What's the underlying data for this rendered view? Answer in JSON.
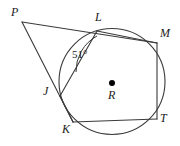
{
  "figure": {
    "type": "circle-geometry-diagram",
    "stroke_color": "#3a3a3a",
    "label_color": "#1a1a1a",
    "background_color": "#ffffff",
    "center_label": "R",
    "center_dot": {
      "x": 112,
      "y": 83,
      "r": 3
    },
    "circle": {
      "cx": 112,
      "cy": 81.5,
      "r": 53
    },
    "angle_marks": [
      {
        "name": "angle-at-L",
        "text": "51°",
        "label_x": 72,
        "label_y": 49,
        "arc_path": "M 76 72 A 40 40 0 0 1 97 36"
      }
    ],
    "points": [
      {
        "name": "P",
        "label": "P",
        "x": 22,
        "y": 22,
        "label_x": 11,
        "label_y": 6,
        "on_circle": false
      },
      {
        "name": "L",
        "label": "L",
        "x": 97,
        "y": 31,
        "label_x": 95,
        "label_y": 11,
        "on_circle": true
      },
      {
        "name": "M",
        "label": "M",
        "x": 157,
        "y": 43,
        "label_x": 160,
        "label_y": 27,
        "on_circle": true
      },
      {
        "name": "J",
        "label": "J",
        "x": 60,
        "y": 96,
        "label_x": 43,
        "label_y": 85,
        "on_circle": true
      },
      {
        "name": "K",
        "label": "K",
        "x": 73,
        "y": 122,
        "label_x": 62,
        "label_y": 123,
        "on_circle": true
      },
      {
        "name": "T",
        "label": "T",
        "x": 157,
        "y": 119,
        "label_x": 160,
        "label_y": 112,
        "on_circle": true
      }
    ],
    "segments": [
      {
        "name": "segment-P-M",
        "from": "P",
        "to": "M",
        "x1": 22,
        "y1": 22,
        "x2": 157,
        "y2": 43
      },
      {
        "name": "segment-P-K",
        "from": "P",
        "to": "K",
        "x1": 22,
        "y1": 22,
        "x2": 73,
        "y2": 122
      },
      {
        "name": "segment-L-M",
        "from": "L",
        "to": "M",
        "x1": 97,
        "y1": 31,
        "x2": 157,
        "y2": 43
      },
      {
        "name": "segment-M-T",
        "from": "M",
        "to": "T",
        "x1": 157,
        "y1": 43,
        "x2": 157,
        "y2": 119
      },
      {
        "name": "segment-K-T",
        "from": "K",
        "to": "T",
        "x1": 73,
        "y1": 122,
        "x2": 157,
        "y2": 119
      },
      {
        "name": "segment-J-K",
        "from": "J",
        "to": "K",
        "x1": 60,
        "y1": 96,
        "x2": 73,
        "y2": 122
      },
      {
        "name": "segment-J-L",
        "from": "J",
        "to": "L",
        "x1": 60,
        "y1": 96,
        "x2": 97,
        "y2": 31
      }
    ]
  }
}
